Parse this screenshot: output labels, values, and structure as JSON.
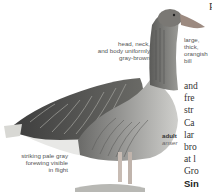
{
  "illustration": {
    "subject": "goose-illustration",
    "annotations": {
      "plumage": [
        "head, neck,",
        "and body uniformly",
        "gray-brown"
      ],
      "bill": [
        "large,",
        "thick,",
        "orangish",
        "bill"
      ],
      "forewing": [
        "striking pale gray",
        "forewing visible",
        "in flight"
      ]
    },
    "caption": {
      "age": "adult",
      "subspecies": "anser"
    }
  },
  "body_text": {
    "top_letter": "P",
    "lines": [
      "and",
      "fre",
      "str",
      "Ca",
      "lar",
      "bro",
      "at l",
      "Gro"
    ],
    "bold_line": "Sin"
  },
  "colors": {
    "background": "#ffffff",
    "plumage_dark": "#4a4a4a",
    "plumage_mid": "#8a8a86",
    "bill": "#9c8a80",
    "text": "#555555"
  }
}
